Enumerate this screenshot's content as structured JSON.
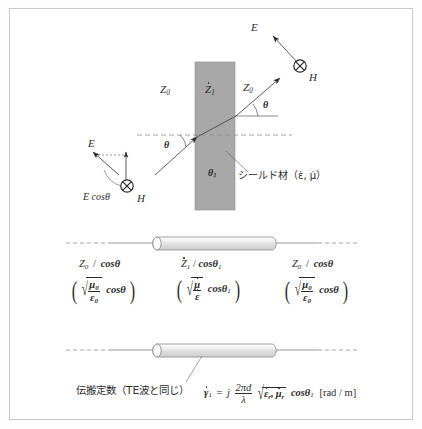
{
  "figure": {
    "border_color": "#c9c9c9",
    "slab_fill": "#a8a8a8",
    "line_color": "#555555",
    "text_color": "#2b2b2b"
  },
  "incidence_diagram": {
    "impedance_left": "Z",
    "impedance_left_sub": "0",
    "impedance_slab": "Z",
    "impedance_slab_sub": "1",
    "impedance_right": "Z",
    "impedance_right_sub": "0",
    "angle_outer": "θ",
    "angle_inner": "θ",
    "angle_inner_sub": "1",
    "shield_label": "シールド材（ε̇, μ̇）",
    "field_right": {
      "e_label": "E",
      "h_label": "H",
      "h_symbol": "⊗"
    },
    "field_left": {
      "e_label": "E",
      "e_cos_label": "E cosθ",
      "h_label": "H",
      "h_symbol": "⊗"
    }
  },
  "transmission_line": {
    "segments": [
      {
        "impedance_num": "Z",
        "impedance_sub": "0",
        "impedance_den": "cosθ",
        "expr_mu": "μ",
        "expr_mu_sub": "0",
        "expr_eps": "ε",
        "expr_eps_sub": "0",
        "expr_cos": "cosθ",
        "expr_cos_sub": ""
      },
      {
        "impedance_num": "Z",
        "impedance_sub": "1",
        "impedance_den": "cosθ",
        "impedance_den_sub": "1",
        "expr_mu": "μ",
        "expr_mu_sub": "",
        "expr_eps": "ε",
        "expr_eps_sub": "",
        "expr_cos": "cosθ",
        "expr_cos_sub": "1"
      },
      {
        "impedance_num": "Z",
        "impedance_sub": "0",
        "impedance_den": "cosθ",
        "expr_mu": "μ",
        "expr_mu_sub": "0",
        "expr_eps": "ε",
        "expr_eps_sub": "0",
        "expr_cos": "cosθ",
        "expr_cos_sub": ""
      }
    ]
  },
  "propagation": {
    "caption": "伝搬定数（TE波と同じ）",
    "gamma": "γ",
    "gamma_sub": "1",
    "equals": "=",
    "j": "j",
    "frac_num": "2πd",
    "frac_den": "λ",
    "radical_eps": "ε",
    "radical_eps_sub": "r",
    "radical_mu": "μ",
    "radical_mu_sub": "r",
    "cos_term": "cosθ",
    "cos_term_sub": "1",
    "unit": "[rad / m]"
  }
}
